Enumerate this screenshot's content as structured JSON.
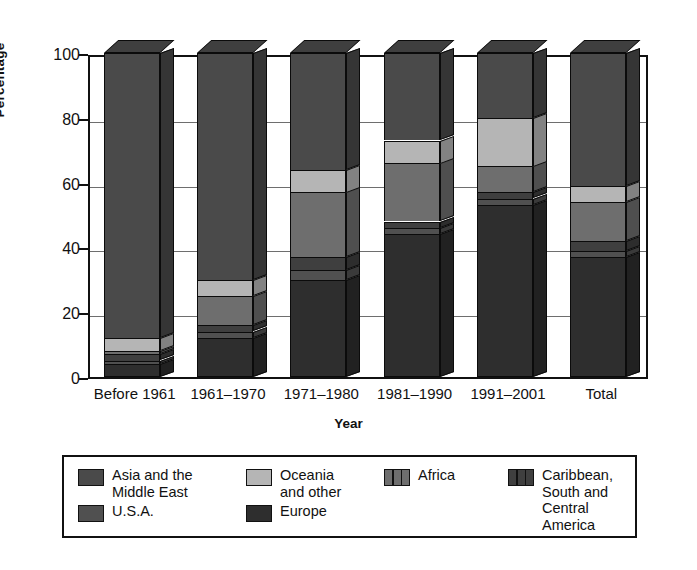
{
  "chart_data": {
    "type": "bar",
    "subtype": "stacked-column-3d-percentage",
    "title": "",
    "xlabel": "Year",
    "ylabel": "Percentage",
    "ylim": [
      0,
      100
    ],
    "yticks": [
      0,
      20,
      40,
      60,
      80,
      100
    ],
    "grid": true,
    "legend_position": "bottom",
    "categories": [
      "Before 1961",
      "1961–1970",
      "1971–1980",
      "1981–1990",
      "1991–2001",
      "Total"
    ],
    "series": [
      {
        "name": "Asia and the Middle East",
        "color": "#4a4a4a",
        "values": [
          88,
          70,
          36,
          27,
          20,
          41
        ]
      },
      {
        "name": "Oceania and other",
        "color": "#b5b5b5",
        "values": [
          4,
          5,
          7,
          7,
          15,
          5
        ]
      },
      {
        "name": "Africa",
        "color": "#6e6e6e",
        "values": [
          1,
          9,
          20,
          18,
          8,
          12
        ]
      },
      {
        "name": "Caribbean, South and Central America",
        "color": "#3f3f3f",
        "values": [
          2,
          2,
          4,
          2,
          2,
          3
        ]
      },
      {
        "name": "U.S.A.",
        "color": "#505050",
        "values": [
          1,
          2,
          3,
          2,
          2,
          2
        ]
      },
      {
        "name": "Europe",
        "color": "#2e2e2e",
        "values": [
          4,
          12,
          30,
          44,
          53,
          37
        ]
      }
    ]
  },
  "axes": {
    "y_title": "Percentage",
    "x_title": "Year",
    "y_tick_labels": [
      "100",
      "80",
      "60",
      "40",
      "20",
      "0"
    ],
    "x_tick_labels": [
      "Before 1961",
      "1961–1970",
      "1971–1980",
      "1981–1990",
      "1991–2001",
      "Total"
    ]
  },
  "legend": {
    "rows": [
      [
        {
          "label": "Asia and the\nMiddle East",
          "color": "#4a4a4a",
          "split": false
        },
        {
          "label": "Oceania\nand other",
          "color": "#b5b5b5",
          "split": false
        },
        {
          "label": "Africa",
          "color": "#6e6e6e",
          "split": true
        },
        {
          "label": "Caribbean, South and\nCentral America",
          "color": "#3f3f3f",
          "split": true
        }
      ],
      [
        {
          "label": "U.S.A.",
          "color": "#505050",
          "split": false
        },
        {
          "label": "Europe",
          "color": "#2e2e2e",
          "split": false
        }
      ]
    ]
  },
  "colors": {
    "axis": "#111111",
    "gridline": "#6e6e6e",
    "background": "#ffffff",
    "bar_outline": "#0b0b0b"
  }
}
